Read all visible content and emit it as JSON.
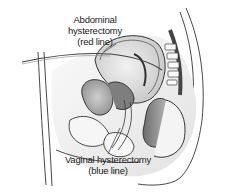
{
  "figure": {
    "labels": {
      "abdominal": {
        "line1": "Abdominal",
        "line2": "hysterectomy",
        "line3": "(red line)"
      },
      "vaginal": {
        "line1": "Vaginal hysterectomy",
        "line2": "(blue line)"
      }
    },
    "colors": {
      "background": "#ffffff",
      "outline": "#333333",
      "light_fill": "#e6e6e6",
      "mid_fill": "#bdbdbd",
      "dark_fill": "#7a7a7a"
    }
  }
}
